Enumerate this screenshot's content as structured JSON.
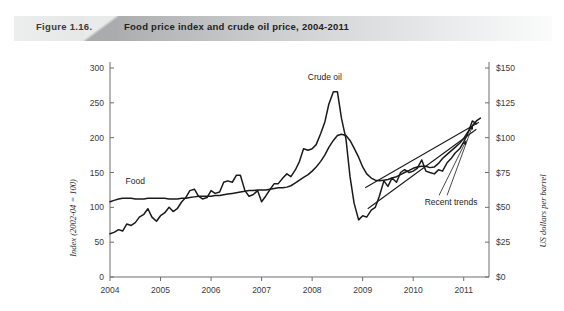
{
  "figure": {
    "number_label": "Figure 1.16.",
    "title": "Food price index and crude oil price, 2004-2011"
  },
  "chart_data": {
    "type": "line",
    "title": "Food price index and crude oil price, 2004-2011",
    "xlabel": "",
    "ylabel": "Index (2002-04 = 100)",
    "y2label": "US dollars per barrel",
    "xlim": [
      2004.0,
      2011.5
    ],
    "ylim": [
      0,
      300
    ],
    "y2lim": [
      0,
      150
    ],
    "grid": false,
    "legend_position": "inline-annotation",
    "x_ticks": [
      "2004",
      "2005",
      "2006",
      "2007",
      "2008",
      "2009",
      "2010",
      "2011"
    ],
    "x_tick_values": [
      2004,
      2005,
      2006,
      2007,
      2008,
      2009,
      2010,
      2011
    ],
    "y_ticks": [
      "0",
      "50",
      "100",
      "150",
      "200",
      "250",
      "300"
    ],
    "y_tick_values": [
      0,
      50,
      100,
      150,
      200,
      250,
      300
    ],
    "y2_ticks": [
      "$0",
      "$25",
      "$50",
      "$75",
      "$100",
      "$125",
      "$150"
    ],
    "y2_tick_values": [
      0,
      25,
      50,
      75,
      100,
      125,
      150
    ],
    "annotations": [
      {
        "text": "Crude oil",
        "x": 2008.25,
        "y": 283
      },
      {
        "text": "Food",
        "x": 2004.5,
        "y": 133
      },
      {
        "text": "Recent trends",
        "x": 2010.75,
        "y": 103
      }
    ],
    "series": [
      {
        "name": "Food",
        "axis": "left",
        "units": "Index (2002-04 = 100)",
        "x": [
          2004.0,
          2004.08,
          2004.17,
          2004.25,
          2004.33,
          2004.42,
          2004.5,
          2004.58,
          2004.67,
          2004.75,
          2004.83,
          2004.92,
          2005.0,
          2005.08,
          2005.17,
          2005.25,
          2005.33,
          2005.42,
          2005.5,
          2005.58,
          2005.67,
          2005.75,
          2005.83,
          2005.92,
          2006.0,
          2006.08,
          2006.17,
          2006.25,
          2006.33,
          2006.42,
          2006.5,
          2006.58,
          2006.67,
          2006.75,
          2006.83,
          2006.92,
          2007.0,
          2007.08,
          2007.17,
          2007.25,
          2007.33,
          2007.42,
          2007.5,
          2007.58,
          2007.67,
          2007.75,
          2007.83,
          2007.92,
          2008.0,
          2008.08,
          2008.17,
          2008.25,
          2008.33,
          2008.42,
          2008.5,
          2008.58,
          2008.67,
          2008.75,
          2008.83,
          2008.92,
          2009.0,
          2009.08,
          2009.17,
          2009.25,
          2009.33,
          2009.42,
          2009.5,
          2009.58,
          2009.67,
          2009.75,
          2009.83,
          2009.92,
          2010.0,
          2010.08,
          2010.17,
          2010.25,
          2010.33,
          2010.42,
          2010.5,
          2010.58,
          2010.67,
          2010.75,
          2010.83,
          2010.92,
          2011.0,
          2011.08,
          2011.17,
          2011.25,
          2011.33
        ],
        "values": [
          108,
          110,
          112,
          113,
          113,
          113,
          112,
          112,
          112,
          113,
          113,
          113,
          113,
          113,
          112,
          112,
          112,
          113,
          113,
          114,
          115,
          116,
          116,
          116,
          116,
          117,
          117,
          118,
          119,
          120,
          121,
          122,
          123,
          124,
          124,
          125,
          125,
          125,
          126,
          127,
          128,
          128,
          129,
          131,
          135,
          139,
          143,
          147,
          152,
          158,
          166,
          175,
          186,
          196,
          203,
          205,
          203,
          196,
          185,
          172,
          158,
          148,
          142,
          139,
          138,
          139,
          140,
          142,
          144,
          147,
          150,
          153,
          156,
          158,
          159,
          159,
          157,
          158,
          163,
          170,
          176,
          181,
          186,
          192,
          199,
          208,
          217,
          224,
          228
        ]
      },
      {
        "name": "Crude oil",
        "axis": "right",
        "units": "US dollars per barrel",
        "x": [
          2004.0,
          2004.08,
          2004.17,
          2004.25,
          2004.33,
          2004.42,
          2004.5,
          2004.58,
          2004.67,
          2004.75,
          2004.83,
          2004.92,
          2005.0,
          2005.08,
          2005.17,
          2005.25,
          2005.33,
          2005.42,
          2005.5,
          2005.58,
          2005.67,
          2005.75,
          2005.83,
          2005.92,
          2006.0,
          2006.08,
          2006.17,
          2006.25,
          2006.33,
          2006.42,
          2006.5,
          2006.58,
          2006.67,
          2006.75,
          2006.83,
          2006.92,
          2007.0,
          2007.08,
          2007.17,
          2007.25,
          2007.33,
          2007.42,
          2007.5,
          2007.58,
          2007.67,
          2007.75,
          2007.83,
          2007.92,
          2008.0,
          2008.08,
          2008.17,
          2008.25,
          2008.33,
          2008.42,
          2008.5,
          2008.58,
          2008.67,
          2008.75,
          2008.83,
          2008.92,
          2009.0,
          2009.08,
          2009.17,
          2009.25,
          2009.33,
          2009.42,
          2009.5,
          2009.58,
          2009.67,
          2009.75,
          2009.83,
          2009.92,
          2010.0,
          2010.08,
          2010.17,
          2010.25,
          2010.33,
          2010.42,
          2010.5,
          2010.58,
          2010.67,
          2010.75,
          2010.83,
          2010.92,
          2011.0,
          2011.08,
          2011.17,
          2011.25,
          2011.33
        ],
        "values_usd_per_barrel": [
          31,
          32,
          34,
          33,
          38,
          37,
          39,
          43,
          45,
          49,
          43,
          40,
          44,
          46,
          50,
          47,
          49,
          54,
          57,
          62,
          63,
          58,
          56,
          57,
          62,
          60,
          61,
          68,
          69,
          68,
          73,
          73,
          62,
          58,
          59,
          62,
          54,
          58,
          63,
          67,
          67,
          71,
          74,
          72,
          77,
          83,
          92,
          91,
          92,
          95,
          103,
          111,
          124,
          133,
          133,
          114,
          99,
          72,
          53,
          41,
          44,
          43,
          48,
          50,
          58,
          69,
          65,
          71,
          68,
          75,
          77,
          75,
          76,
          78,
          84,
          76,
          75,
          74,
          77,
          76,
          82,
          85,
          89,
          92,
          97,
          103,
          112,
          110
        ],
        "values_index_scale": [
          62,
          64,
          68,
          66,
          76,
          74,
          78,
          86,
          90,
          98,
          86,
          80,
          88,
          92,
          100,
          94,
          98,
          108,
          114,
          124,
          126,
          116,
          112,
          114,
          124,
          120,
          122,
          136,
          138,
          136,
          146,
          146,
          124,
          116,
          118,
          124,
          108,
          116,
          126,
          134,
          134,
          142,
          148,
          144,
          154,
          166,
          184,
          182,
          184,
          190,
          206,
          222,
          248,
          266,
          266,
          228,
          198,
          144,
          106,
          82,
          88,
          86,
          96,
          100,
          116,
          138,
          130,
          142,
          136,
          150,
          154,
          150,
          152,
          156,
          168,
          152,
          150,
          148,
          154,
          152,
          164,
          170,
          178,
          184,
          194,
          206,
          224,
          220
        ]
      },
      {
        "name": "Recent trend (food)",
        "type": "trendline",
        "axis": "left",
        "x": [
          2009.05,
          2011.3
        ],
        "values": [
          128,
          222
        ]
      },
      {
        "name": "Recent trend (crude oil)",
        "type": "trendline",
        "axis": "left",
        "x": [
          2009.1,
          2011.25
        ],
        "values": [
          98,
          212
        ]
      }
    ]
  },
  "source_note": ""
}
